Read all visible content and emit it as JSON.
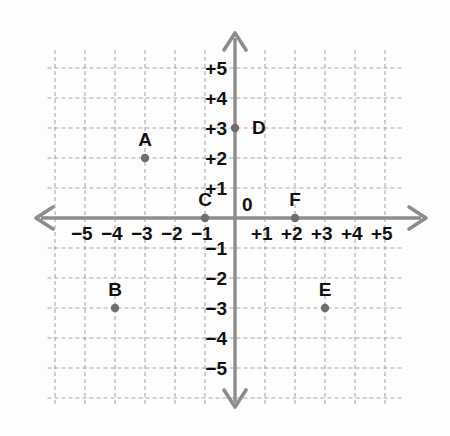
{
  "figure": {
    "kind": "coordinate-plane",
    "background_color": "#fdfdfd",
    "grid_color": "#9a9a9a",
    "axis_color": "#8c8c8c",
    "point_color": "#6e6e6e",
    "text_color": "#111111",
    "origin_label": "0"
  },
  "chart_data": {
    "type": "scatter",
    "title": "",
    "xlabel": "",
    "ylabel": "",
    "xlim": [
      -6,
      6
    ],
    "ylim": [
      -6,
      6
    ],
    "grid": true,
    "legend": "none",
    "x_tick_labels": [
      "−5",
      "−4",
      "−3",
      "−2",
      "−1",
      "+1",
      "+2",
      "+3",
      "+4",
      "+5"
    ],
    "x_tick_values": [
      -5,
      -4,
      -3,
      -2,
      -1,
      1,
      2,
      3,
      4,
      5
    ],
    "y_tick_labels": [
      "+5",
      "+4",
      "+3",
      "+2",
      "+1",
      "−1",
      "−2",
      "−3",
      "−4",
      "−5"
    ],
    "y_tick_values": [
      5,
      4,
      3,
      2,
      1,
      -1,
      -2,
      -3,
      -4,
      -5
    ],
    "points": [
      {
        "label": "A",
        "x": -3,
        "y": 2,
        "label_dx": 0,
        "label_dy": -12
      },
      {
        "label": "B",
        "x": -4,
        "y": -3,
        "label_dx": 0,
        "label_dy": -12
      },
      {
        "label": "C",
        "x": -1,
        "y": 0,
        "label_dx": 0,
        "label_dy": -12
      },
      {
        "label": "D",
        "x": 0,
        "y": 3,
        "label_dx": 17,
        "label_dy": 6
      },
      {
        "label": "E",
        "x": 3,
        "y": -3,
        "label_dx": 0,
        "label_dy": -12
      },
      {
        "label": "F",
        "x": 2,
        "y": 0,
        "label_dx": 0,
        "label_dy": -12
      }
    ]
  }
}
